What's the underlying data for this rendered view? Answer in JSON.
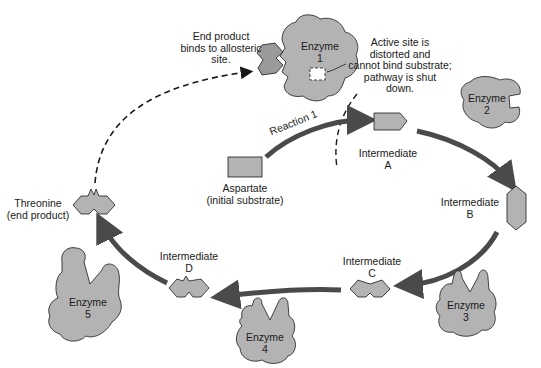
{
  "diagram": {
    "colors": {
      "shape_fill": "#b3b3b3",
      "dark_fill": "#9a9a9a",
      "arrow": "#4a4a4a",
      "dashed": "#1a1a1a",
      "background": "#ffffff"
    },
    "annotations": {
      "allosteric": [
        "End product",
        "binds to allosteric",
        "site."
      ],
      "active_site": [
        "Active site is",
        "distorted and",
        "cannot bind substrate;",
        "pathway is shut",
        "down."
      ]
    },
    "reaction_label": "Reaction 1",
    "substrate": {
      "name": "Aspartate",
      "role": "(initial substrate)"
    },
    "end_product": {
      "name": "Threonine",
      "role": "(end product)"
    },
    "intermediates": [
      {
        "name": "Intermediate",
        "letter": "A"
      },
      {
        "name": "Intermediate",
        "letter": "B"
      },
      {
        "name": "Intermediate",
        "letter": "C"
      },
      {
        "name": "Intermediate",
        "letter": "D"
      }
    ],
    "enzymes": [
      {
        "name": "Enzyme",
        "number": "1"
      },
      {
        "name": "Enzyme",
        "number": "2"
      },
      {
        "name": "Enzyme",
        "number": "3"
      },
      {
        "name": "Enzyme",
        "number": "4"
      },
      {
        "name": "Enzyme",
        "number": "5"
      }
    ]
  }
}
